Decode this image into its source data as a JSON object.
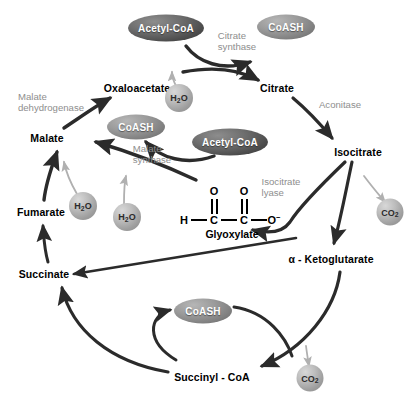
{
  "diagram": {
    "background_color": "#ffffff",
    "width": 420,
    "height": 403
  },
  "metabolites": [
    {
      "id": "oxaloacetate",
      "label": "Oxaloacetate",
      "x": 137,
      "y": 88
    },
    {
      "id": "citrate",
      "label": "Citrate",
      "x": 277,
      "y": 88
    },
    {
      "id": "isocitrate",
      "label": "Isocitrate",
      "x": 358,
      "y": 152
    },
    {
      "id": "ketoglutarate",
      "label": "α - Ketoglutarate",
      "x": 331,
      "y": 259
    },
    {
      "id": "succinyl-coa",
      "label": "Succinyl - CoA",
      "x": 212,
      "y": 377
    },
    {
      "id": "succinate",
      "label": "Succinate",
      "x": 44,
      "y": 274
    },
    {
      "id": "fumarate",
      "label": "Fumarate",
      "x": 41,
      "y": 212
    },
    {
      "id": "malate",
      "label": "Malate",
      "x": 47,
      "y": 138
    }
  ],
  "enzymes": [
    {
      "id": "citrate-synthase",
      "label": "Citrate\nsynthase",
      "x": 237,
      "y": 42
    },
    {
      "id": "aconitase",
      "label": "Aconitase",
      "x": 340,
      "y": 105
    },
    {
      "id": "isocitrate-lyase",
      "label": "Isocitrate\nlyase",
      "x": 281,
      "y": 188
    },
    {
      "id": "malate-synthase",
      "label": "Malate\nsynthase",
      "x": 152,
      "y": 155
    },
    {
      "id": "malate-dehydrogenase",
      "label": "Malate\ndehydrogenase",
      "x": 51,
      "y": 103
    }
  ],
  "cofactor_bubbles": [
    {
      "id": "acetyl-coa-top",
      "label": "Acetyl-CoA",
      "x": 166,
      "y": 28,
      "w": 76,
      "h": 27,
      "shade": "dark"
    },
    {
      "id": "coash-top",
      "label": "CoASH",
      "x": 286,
      "y": 27,
      "w": 58,
      "h": 25,
      "shade": "mid"
    },
    {
      "id": "coash-mid",
      "label": "CoASH",
      "x": 136,
      "y": 127,
      "w": 58,
      "h": 25,
      "shade": "mid"
    },
    {
      "id": "acetyl-coa-mid",
      "label": "Acetyl-CoA",
      "x": 230,
      "y": 142,
      "w": 76,
      "h": 27,
      "shade": "dark"
    },
    {
      "id": "coash-bottom",
      "label": "CoASH",
      "x": 203,
      "y": 311,
      "w": 58,
      "h": 25,
      "shade": "mid"
    }
  ],
  "spheres": [
    {
      "id": "water-oxaloacetate",
      "label": "H₂O",
      "x": 179,
      "y": 98,
      "d": 28
    },
    {
      "id": "water-fumarate",
      "label": "H₂O",
      "x": 83,
      "y": 206,
      "d": 28
    },
    {
      "id": "water-malate",
      "label": "H₂O",
      "x": 127,
      "y": 217,
      "d": 28
    },
    {
      "id": "co2-isocitrate",
      "label": "CO₂",
      "x": 390,
      "y": 212,
      "d": 27
    },
    {
      "id": "co2-succinyl",
      "label": "CO₂",
      "x": 310,
      "y": 378,
      "d": 27
    }
  ],
  "glyoxylate_structure": {
    "name": "Glyoxylate",
    "atoms": {
      "h": "H",
      "c1": "C",
      "c2": "C",
      "o_top_left": "O",
      "o_top_right": "O",
      "o_minus": "O",
      "charge": "−"
    }
  },
  "colors": {
    "metabolite_text": "#000000",
    "enzyme_text": "#8e8e8e",
    "arrow_dark": "#2b2b2b",
    "arrow_light": "#b0b0b0",
    "bubble_dark": "#4c4c4c",
    "bubble_mid": "#8a8a8a",
    "sphere": "#a8a8a8",
    "background": "#ffffff"
  }
}
